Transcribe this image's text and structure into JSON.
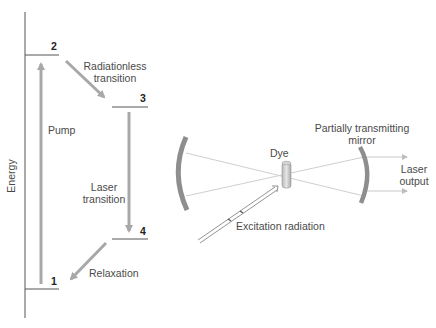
{
  "energy_diagram": {
    "axis_label": "Energy",
    "levels": [
      {
        "id": "1",
        "label": "1"
      },
      {
        "id": "2",
        "label": "2"
      },
      {
        "id": "3",
        "label": "3"
      },
      {
        "id": "4",
        "label": "4"
      }
    ],
    "transitions": {
      "pump": "Pump",
      "radiationless_line1": "Radiationless",
      "radiationless_line2": "transition",
      "laser_line1": "Laser",
      "laser_line2": "transition",
      "relaxation": "Relaxation"
    }
  },
  "laser_cavity": {
    "dye": "Dye",
    "mirror_line1": "Partially transmitting",
    "mirror_line2": "mirror",
    "output_line1": "Laser",
    "output_line2": "output",
    "excitation": "Excitation radiation"
  },
  "colors": {
    "arrow": "#a8a8a8",
    "mirror": "#8c8c8c",
    "ray": "#c8c8c8",
    "level_line": "#555555"
  }
}
